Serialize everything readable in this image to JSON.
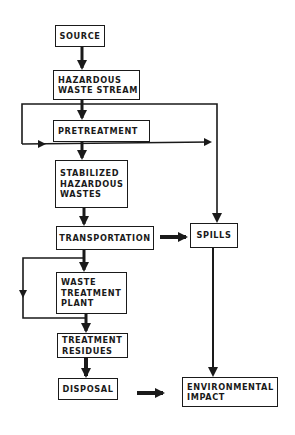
{
  "diagram": {
    "title": "",
    "nodes": [
      {
        "id": "source",
        "lines": [
          "SOURCE"
        ]
      },
      {
        "id": "hazardous_waste_stream",
        "lines": [
          "HAZARDOUS",
          "WASTE STREAM"
        ]
      },
      {
        "id": "pretreatment",
        "lines": [
          "PRETREATMENT"
        ]
      },
      {
        "id": "stabilized_hazardous_wastes",
        "lines": [
          "STABILIZED",
          "HAZARDOUS",
          "WASTES"
        ]
      },
      {
        "id": "transportation",
        "lines": [
          "TRANSPORTATION"
        ]
      },
      {
        "id": "spills",
        "lines": [
          "SPILLS"
        ]
      },
      {
        "id": "waste_treatment_plant",
        "lines": [
          "WASTE",
          "TREATMENT",
          "PLANT"
        ]
      },
      {
        "id": "treatment_residues",
        "lines": [
          "TREATMENT",
          "RESIDUES"
        ]
      },
      {
        "id": "disposal",
        "lines": [
          "DISPOSAL"
        ]
      },
      {
        "id": "environmental_impact",
        "lines": [
          "ENVIRONMENTAL",
          "IMPACT"
        ]
      }
    ],
    "edges": [
      {
        "from": "source",
        "to": "hazardous_waste_stream"
      },
      {
        "from": "hazardous_waste_stream",
        "to": "pretreatment"
      },
      {
        "from": "hazardous_waste_stream",
        "to": "stabilized_hazardous_wastes",
        "note": "bypass loop on left"
      },
      {
        "from": "hazardous_waste_stream",
        "to": "spills",
        "note": "right branch"
      },
      {
        "from": "pretreatment",
        "to": "stabilized_hazardous_wastes"
      },
      {
        "from": "stabilized_hazardous_wastes",
        "to": "transportation"
      },
      {
        "from": "transportation",
        "to": "spills"
      },
      {
        "from": "transportation",
        "to": "waste_treatment_plant"
      },
      {
        "from": "transportation",
        "to": "treatment_residues",
        "note": "bypass loop on left"
      },
      {
        "from": "waste_treatment_plant",
        "to": "treatment_residues"
      },
      {
        "from": "treatment_residues",
        "to": "disposal"
      },
      {
        "from": "disposal",
        "to": "environmental_impact"
      },
      {
        "from": "spills",
        "to": "environmental_impact"
      }
    ]
  }
}
